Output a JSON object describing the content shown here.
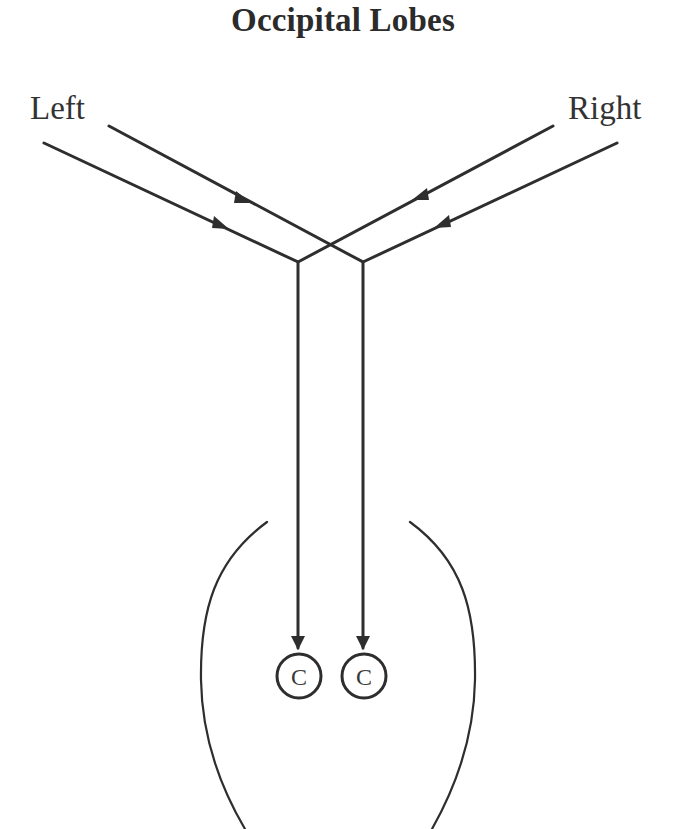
{
  "title": "Occipital Lobes",
  "labels": {
    "left": "Left",
    "right": "Right"
  },
  "nodes": [
    {
      "id": "c-left",
      "label": "C"
    },
    {
      "id": "c-right",
      "label": "C"
    }
  ],
  "colors": {
    "stroke": "#2e2e2e",
    "background": "#ffffff"
  },
  "diagram": {
    "paths": [
      {
        "name": "left-outer-path",
        "from": "Left",
        "to": "c-left"
      },
      {
        "name": "left-inner-path",
        "from": "Left",
        "to": "c-right"
      },
      {
        "name": "right-inner-path",
        "from": "Right",
        "to": "c-left"
      },
      {
        "name": "right-outer-path",
        "from": "Right",
        "to": "c-right"
      }
    ]
  }
}
